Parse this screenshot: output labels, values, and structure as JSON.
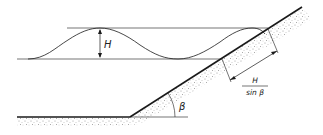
{
  "diagram": {
    "type": "wave-on-slope",
    "labels": {
      "wave_height": "H",
      "slope_angle": "β",
      "fraction_numerator": "H",
      "fraction_denominator": "sin β"
    },
    "colors": {
      "line": "#1a1a1a",
      "sediment": "#9a9a9a",
      "background": "#ffffff"
    }
  }
}
